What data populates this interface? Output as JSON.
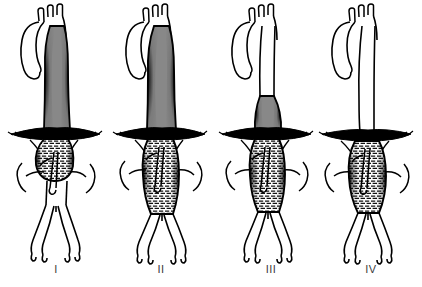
{
  "illustration": {
    "title": "Crawford classification of thoracoabdominal aortic aneurysms",
    "style": "black-and-white pen-and-ink hatched medical line drawing",
    "background_color": "#ffffff",
    "ink_color": "#000000",
    "label_color": "#3b3b3b"
  },
  "figures": [
    {
      "label": "I",
      "name": "crawford-type-1",
      "description": "Aneurysm of most of descending thoracic aorta from just distal to left subclavian artery to upper abdominal aorta above the renal arteries",
      "aneurysm_extent": "descending thoracic aorta to suprarenal abdominal aorta",
      "thoracic_aorta": "aneurysmal",
      "abdominal_aorta": "normal below renal arteries",
      "shaded_segment_top_y": 30,
      "shaded_segment_bottom_y": 168
    },
    {
      "label": "II",
      "name": "crawford-type-2",
      "description": "Aneurysm of entire descending thoracic aorta extending to the aortic bifurcation; most extensive type",
      "aneurysm_extent": "left subclavian artery to aortoiliac bifurcation",
      "thoracic_aorta": "aneurysmal",
      "abdominal_aorta": "aneurysmal to bifurcation",
      "shaded_segment_top_y": 30,
      "shaded_segment_bottom_y": 225
    },
    {
      "label": "III",
      "name": "crawford-type-3",
      "description": "Aneurysm of distal (lower) descending thoracic aorta extending into the abdominal aorta",
      "aneurysm_extent": "distal descending thoracic aorta to abdominal aorta",
      "thoracic_aorta": "normal proximally, aneurysmal distally",
      "abdominal_aorta": "aneurysmal",
      "shaded_segment_top_y": 96,
      "shaded_segment_bottom_y": 222
    },
    {
      "label": "IV",
      "name": "crawford-type-4",
      "description": "Aneurysm limited to the abdominal aorta, beginning at the diaphragm and involving the visceral segment",
      "aneurysm_extent": "diaphragmatic hiatus to aortic bifurcation",
      "thoracic_aorta": "normal",
      "abdominal_aorta": "aneurysmal",
      "shaded_segment_top_y": 140,
      "shaded_segment_bottom_y": 222
    }
  ],
  "anatomy_parts": [
    {
      "name": "aortic-arch",
      "label": "Aortic arch"
    },
    {
      "name": "brachiocephalic-branches",
      "label": "Three arch branches"
    },
    {
      "name": "ascending-aorta",
      "label": "Ascending aorta"
    },
    {
      "name": "descending-thoracic-aorta",
      "label": "Descending thoracic aorta"
    },
    {
      "name": "diaphragm",
      "label": "Diaphragm"
    },
    {
      "name": "celiac-and-sma",
      "label": "Celiac axis and superior mesenteric artery"
    },
    {
      "name": "renal-arteries",
      "label": "Renal arteries"
    },
    {
      "name": "abdominal-aorta",
      "label": "Abdominal aorta"
    },
    {
      "name": "iliac-arteries",
      "label": "Common, internal and external iliac arteries"
    }
  ]
}
